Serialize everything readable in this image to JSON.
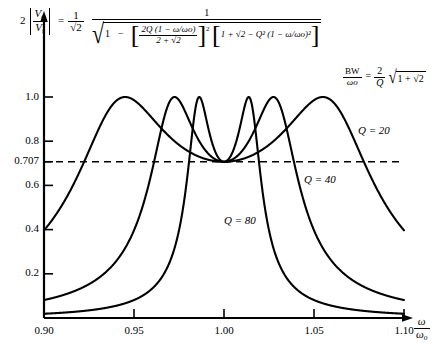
{
  "figure": {
    "title_expression": "2 |Vo/Vi| transfer magnitude versus normalized frequency",
    "y_axis_expression": {
      "lead_number": "2",
      "numerator_v": "V",
      "numerator_sub": "o",
      "denominator_v": "V",
      "denominator_sub": "i",
      "equals": "=",
      "prefactor_num": "1",
      "prefactor_den": "√2"
    },
    "main_formula": {
      "numerator": "1",
      "denom_radical_lead": "1",
      "minus": "−",
      "bracket1_num": "2Q (1 − ω/ωo)",
      "bracket1_den": "2 + √2",
      "bracket1_exp": "2",
      "bracket2": "1 + √2 − Q² (1 − ω/ωo)²"
    },
    "bw_formula": {
      "bw_num": "BW",
      "bw_den": "ωo",
      "equals": "=",
      "rhs_num": "2",
      "rhs_den": "Q",
      "radicand": "1 + √2"
    },
    "curve_labels": [
      {
        "name": "q20",
        "text": "Q = 20",
        "q": 20
      },
      {
        "name": "q40",
        "text": "Q = 40",
        "q": 40
      },
      {
        "name": "q80",
        "text": "Q = 80",
        "q": 80
      }
    ],
    "dashed_line_value": 0.707
  },
  "chart_data": {
    "type": "line",
    "title": "",
    "xlabel": "ω/ωo",
    "ylabel": "2 |Vo/Vi|",
    "xlim": [
      0.9,
      1.1
    ],
    "ylim": [
      0.0,
      1.085
    ],
    "grid": false,
    "legend": "inline-annotations",
    "x_ticks": [
      0.9,
      0.95,
      1.0,
      1.05,
      1.1
    ],
    "x_tick_labels": [
      "0.90",
      "0.95",
      "1.00",
      "1.05",
      "1.10"
    ],
    "y_ticks": [
      0.2,
      0.4,
      0.6,
      0.707,
      0.8,
      1.0
    ],
    "y_tick_labels": [
      "0.2",
      "0.4",
      "0.6",
      "0.707",
      "0.8",
      "1.0"
    ],
    "reference_lines": [
      {
        "name": "half-power",
        "orientation": "horizontal",
        "value": 0.707,
        "style": "dashed"
      }
    ],
    "series": [
      {
        "name": "Q = 20",
        "q": 20,
        "peak_value": 1.0,
        "center_value": 0.707,
        "peak_positions": [
          0.9465,
          1.0535
        ],
        "half_power_crossings": [
          0.9215,
          1.0785
        ]
      },
      {
        "name": "Q = 40",
        "q": 40,
        "peak_value": 1.0,
        "center_value": 0.707,
        "peak_positions": [
          0.9733,
          1.0267
        ],
        "half_power_crossings": [
          0.9608,
          1.0392
        ]
      },
      {
        "name": "Q = 80",
        "q": 80,
        "peak_value": 1.0,
        "center_value": 0.707,
        "peak_positions": [
          0.9866,
          1.0134
        ],
        "half_power_crossings": [
          0.9804,
          1.0196
        ]
      }
    ],
    "equation": "2|Vo/Vi| = (1/√2) · 1 / √(1 − [2Q(1−ω/ωo)/(2+√2)]² [1 + √2 − Q²(1−ω/ωo)²])",
    "bandwidth_relation": "BW/ωo = (2/Q)√(1+√2)"
  }
}
